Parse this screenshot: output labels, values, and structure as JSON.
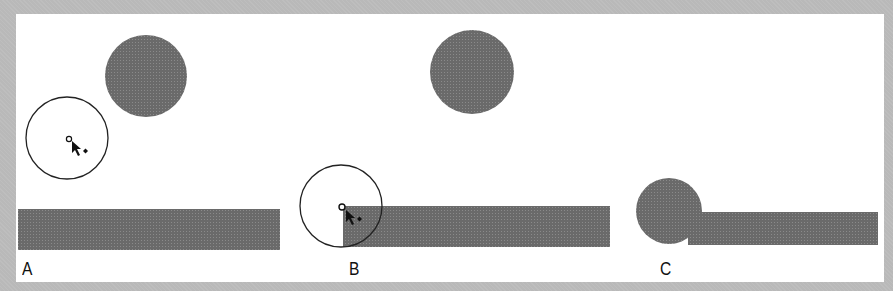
{
  "figure": {
    "panels": [
      {
        "id": "A",
        "label": "A",
        "description": "Circle being drawn away from the rectangle and filled circle"
      },
      {
        "id": "B",
        "label": "B",
        "description": "Circle center snapped to the rectangle's top-left corner"
      },
      {
        "id": "C",
        "label": "C",
        "description": "Filled circle overlapping the left end of the rectangle"
      }
    ],
    "colors": {
      "frame": "#b9b9b9",
      "background": "#ffffff",
      "fill": "#6f6f6f",
      "stroke": "#222222",
      "label": "#111111"
    }
  }
}
